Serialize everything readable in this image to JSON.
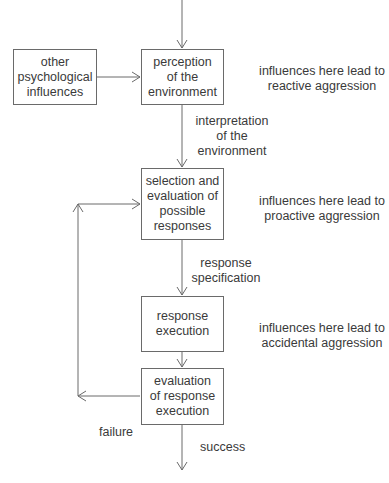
{
  "diagram": {
    "type": "flowchart",
    "nodes": {
      "other": "other\npsychological\ninfluences",
      "perception": "perception\nof the\nenvironment",
      "selection": "selection and\nevaluation of\npossible\nresponses",
      "execution": "response\nexecution",
      "evaluation": "evaluation\nof response\nexecution"
    },
    "edge_labels": {
      "interpretation": "interpretation\nof the\nenvironment",
      "specification": "response\nspecification",
      "failure": "failure",
      "success": "success"
    },
    "annotations": {
      "reactive": "influences here lead to\nreactive aggression",
      "proactive": "influences here lead to\nproactive aggression",
      "accidental": "influences here lead to\naccidental aggression"
    },
    "colors": {
      "line": "#6a6a6a",
      "text": "#3a3a3a",
      "background": "#ffffff"
    }
  }
}
